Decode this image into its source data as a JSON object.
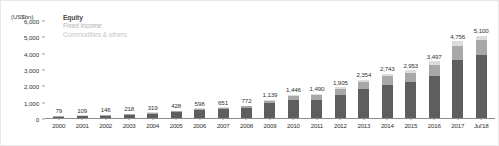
{
  "chart_data": {
    "type": "bar",
    "title": "",
    "subtitle": "",
    "xlabel": "",
    "ylabel": "(US$bn)",
    "unit_caption": "(US$bn)",
    "stacked": true,
    "grid": false,
    "legend_position": "top-left",
    "ylim": [
      0,
      6000
    ],
    "ytick_labels": [
      "6,000",
      "5,000",
      "4,000",
      "3,000",
      "2,000",
      "1,000",
      "0"
    ],
    "ytick_values": [
      6000,
      5000,
      4000,
      3000,
      2000,
      1000,
      0
    ],
    "categories": [
      "2000",
      "2001",
      "2002",
      "2003",
      "2004",
      "2005",
      "2006",
      "2007",
      "2008",
      "2009",
      "2010",
      "2011",
      "2012",
      "2013",
      "2014",
      "2015",
      "2016",
      "2017",
      "Jul'18"
    ],
    "totals": [
      79,
      109,
      146,
      218,
      319,
      428,
      598,
      651,
      772,
      1139,
      1446,
      1490,
      1905,
      2354,
      2743,
      2953,
      3497,
      4756,
      5100
    ],
    "total_labels": [
      "79",
      "109",
      "146",
      "218",
      "319",
      "428",
      "598",
      "651",
      "772",
      "1,139",
      "1,446",
      "1,490",
      "1,905",
      "2,354",
      "2,743",
      "2,953",
      "3,497",
      "4,756",
      "5,100"
    ],
    "series": [
      {
        "name": "Equity",
        "color": "#5e5e5e",
        "values": [
          70,
          96,
          128,
          190,
          277,
          368,
          510,
          550,
          640,
          900,
          1130,
          1140,
          1430,
          1780,
          2060,
          2200,
          2600,
          3580,
          3870
        ]
      },
      {
        "name": "Fixed income",
        "color": "#a8a8a8",
        "values": [
          6,
          9,
          13,
          19,
          29,
          41,
          62,
          70,
          90,
          175,
          240,
          255,
          350,
          440,
          520,
          570,
          680,
          880,
          960
        ]
      },
      {
        "name": "Commodities & others",
        "color": "#dcdcdc",
        "values": [
          3,
          4,
          5,
          9,
          13,
          19,
          26,
          31,
          42,
          64,
          76,
          95,
          125,
          134,
          163,
          183,
          217,
          296,
          270
        ]
      }
    ]
  },
  "legend": {
    "items": [
      {
        "label": "Equity"
      },
      {
        "label": "Fixed income"
      },
      {
        "label": "Commodities & others"
      }
    ]
  },
  "colors": {
    "equity": "#5e5e5e",
    "fixed_income": "#a8a8a8",
    "commodities": "#dcdcdc",
    "axis": "#8c8c8c",
    "text": "#333333",
    "frame": "#e8e8e8"
  }
}
